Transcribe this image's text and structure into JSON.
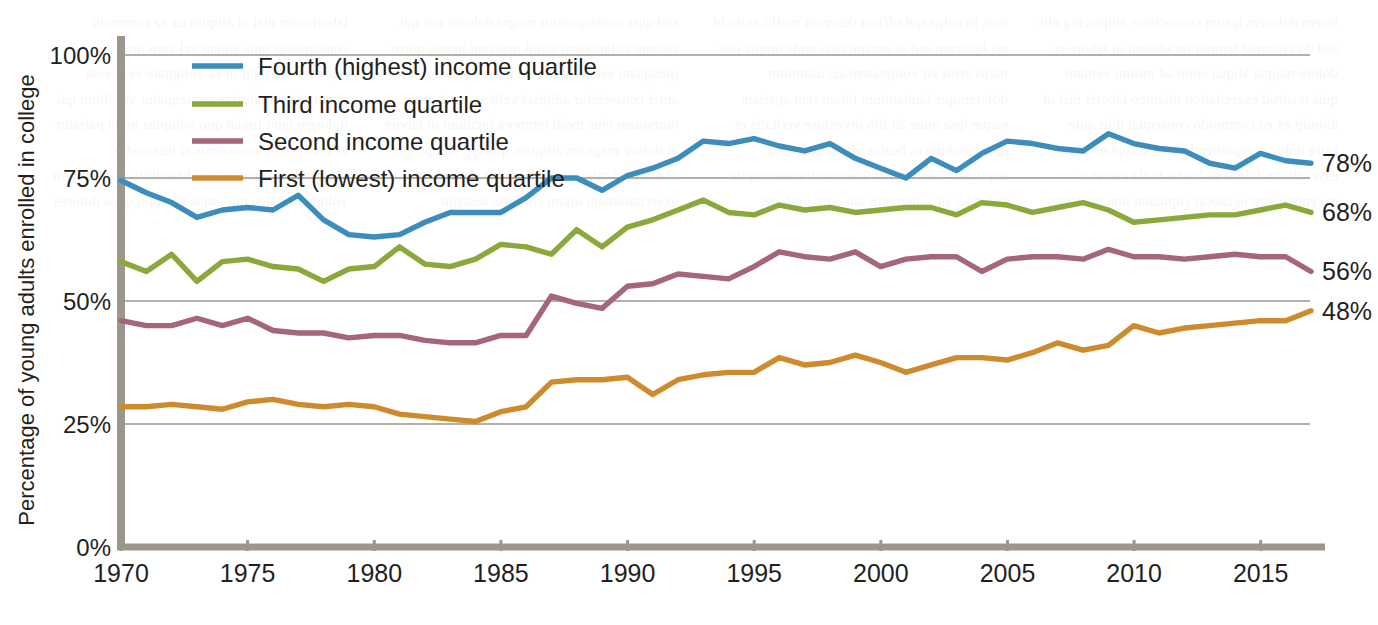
{
  "chart_data": {
    "type": "line",
    "title": "",
    "subtitle": "",
    "xlabel": "",
    "ylabel": "Percentage of young adults enrolled in college",
    "xlim": [
      1970,
      2017
    ],
    "ylim": [
      0,
      100
    ],
    "grid": true,
    "legend_position": "top-left inside plot",
    "x_tick_labels": [
      "1970",
      "1975",
      "1980",
      "1985",
      "1990",
      "1995",
      "2000",
      "2005",
      "2010",
      "2015"
    ],
    "x_ticks": [
      1970,
      1975,
      1980,
      1985,
      1990,
      1995,
      2000,
      2005,
      2010,
      2015
    ],
    "y_tick_labels": [
      "0%",
      "25%",
      "50%",
      "75%",
      "100%"
    ],
    "y_ticks": [
      0,
      25,
      50,
      75,
      100
    ],
    "x": [
      1970,
      1971,
      1972,
      1973,
      1974,
      1975,
      1976,
      1977,
      1978,
      1979,
      1980,
      1981,
      1982,
      1983,
      1984,
      1985,
      1986,
      1987,
      1988,
      1989,
      1990,
      1991,
      1992,
      1993,
      1994,
      1995,
      1996,
      1997,
      1998,
      1999,
      2000,
      2001,
      2002,
      2003,
      2004,
      2005,
      2006,
      2007,
      2008,
      2009,
      2010,
      2011,
      2012,
      2013,
      2014,
      2015,
      2016,
      2017
    ],
    "series": [
      {
        "name": "Fourth (highest) income quartile",
        "color": "#3c8dbc",
        "end_label": "78%",
        "values": [
          74.5,
          72.0,
          70.0,
          67.0,
          68.5,
          69.0,
          68.5,
          71.5,
          66.5,
          63.5,
          63.0,
          63.5,
          66.0,
          68.0,
          68.0,
          68.0,
          71.0,
          75.0,
          75.0,
          72.5,
          75.5,
          77.0,
          79.0,
          82.5,
          82.0,
          83.0,
          81.5,
          80.5,
          82.0,
          79.0,
          77.0,
          75.0,
          79.0,
          76.5,
          80.0,
          82.5,
          82.0,
          81.0,
          80.5,
          84.0,
          82.0,
          81.0,
          80.5,
          78.0,
          77.0,
          80.0,
          78.5,
          78.0
        ]
      },
      {
        "name": "Third income quartile",
        "color": "#8ba83a",
        "end_label": "68%",
        "values": [
          58.0,
          56.0,
          59.5,
          54.0,
          58.0,
          58.5,
          57.0,
          56.5,
          54.0,
          56.5,
          57.0,
          61.0,
          57.5,
          57.0,
          58.5,
          61.5,
          61.0,
          59.5,
          64.5,
          61.0,
          65.0,
          66.5,
          68.5,
          70.5,
          68.0,
          67.5,
          69.5,
          68.5,
          69.0,
          68.0,
          68.5,
          69.0,
          69.0,
          67.5,
          70.0,
          69.5,
          68.0,
          69.0,
          70.0,
          68.5,
          66.0,
          66.5,
          67.0,
          67.5,
          67.5,
          68.5,
          69.5,
          68.0
        ]
      },
      {
        "name": "Second income quartile",
        "color": "#a5657d",
        "end_label": "56%",
        "values": [
          46.0,
          45.0,
          45.0,
          46.5,
          45.0,
          46.5,
          44.0,
          43.5,
          43.5,
          42.5,
          43.0,
          43.0,
          42.0,
          41.5,
          41.5,
          43.0,
          43.0,
          51.0,
          49.5,
          48.5,
          53.0,
          53.5,
          55.5,
          55.0,
          54.5,
          57.0,
          60.0,
          59.0,
          58.5,
          60.0,
          57.0,
          58.5,
          59.0,
          59.0,
          56.0,
          58.5,
          59.0,
          59.0,
          58.5,
          60.5,
          59.0,
          59.0,
          58.5,
          59.0,
          59.5,
          59.0,
          59.0,
          56.0
        ]
      },
      {
        "name": "First (lowest) income quartile",
        "color": "#cd8b2e",
        "end_label": "48%",
        "values": [
          28.5,
          28.5,
          29.0,
          28.5,
          28.0,
          29.5,
          30.0,
          29.0,
          28.5,
          29.0,
          28.5,
          27.0,
          26.5,
          26.0,
          25.5,
          27.5,
          28.5,
          33.5,
          34.0,
          34.0,
          34.5,
          31.0,
          34.0,
          35.0,
          35.5,
          35.5,
          38.5,
          37.0,
          37.5,
          39.0,
          37.5,
          35.5,
          37.0,
          38.5,
          38.5,
          38.0,
          39.5,
          41.5,
          40.0,
          41.0,
          45.0,
          43.5,
          44.5,
          45.0,
          45.5,
          46.0,
          46.0,
          48.0
        ]
      }
    ]
  },
  "legend": {
    "entries": [
      {
        "label": "Fourth (highest) income quartile"
      },
      {
        "label": "Third income quartile"
      },
      {
        "label": "Second income quartile"
      },
      {
        "label": "First (lowest) income quartile"
      }
    ]
  },
  "axes": {
    "y_label": "Percentage of young adults enrolled in college",
    "y_ticks": [
      "100%",
      "75%",
      "50%",
      "25%",
      "0%"
    ],
    "x_ticks": [
      "1970",
      "1975",
      "1980",
      "1985",
      "1990",
      "1995",
      "2000",
      "2005",
      "2010",
      "2015"
    ]
  },
  "end_labels": [
    "78%",
    "68%",
    "56%",
    "48%"
  ],
  "colors": {
    "fourth_quartile": "#3c8dbc",
    "third_quartile": "#8ba83a",
    "second_quartile": "#a5657d",
    "first_quartile": "#cd8b2e",
    "axis": "#9b978c",
    "gridline": "#b3b0aa",
    "text": "#231f20",
    "background": "#ffffff"
  },
  "background_bleed": {
    "col1": "lorem dolorem ipsum consectetur adipiscing elit sed do eiusmod tempor incididunt ut labore et dolore magna aliqua enim ad minim veniam quis nostrud exercitation ullamco laboris nisi ut aliquip ex ea commodo consequat duis aute irure dolor in reprehenderit in voluptate velit esse cillum dolore eu fugiat nulla pariatur excepteur sint occaecat cupidatat non proident",
    "col2": "sunt in culpa qui officia deserunt mollit anim id est laborum sed ut perspiciatis unde omnis iste natus error sit voluptatem accusantium doloremque laudantium totam rem aperiam eaque ipsa quae ab illo inventore veritatis et quasi architecto beatae vitae dicta sunt explicabo nemo enim ipsam voluptatem quia voluptas sit aspernatur aut odit aut fugit",
    "col3": "sed quia consequuntur magni dolores eos qui ratione voluptatem sequi nesciunt neque porro quisquam est qui dolorem ipsum quia dolor sit amet consectetur adipisci velit sed quia non numquam eius modi tempora incidunt ut labore et dolore magnam aliquam quaerat voluptatem ut enim ad minima veniam quis nostrum exercitationem ullam corporis suscipit",
    "col4": "laboriosam nisi ut aliquid ex ea commodi consequatur quis autem vel eum iure reprehenderit qui in ea voluptate velit esse quam nihil molestiae consequatur vel illum qui dolorem eum fugiat quo voluptas nulla pariatur at vero eos et accusamus et iusto odio dignissimos ducimus qui blanditiis praesentium voluptatum deleniti atque corrupti quos dolores"
  }
}
